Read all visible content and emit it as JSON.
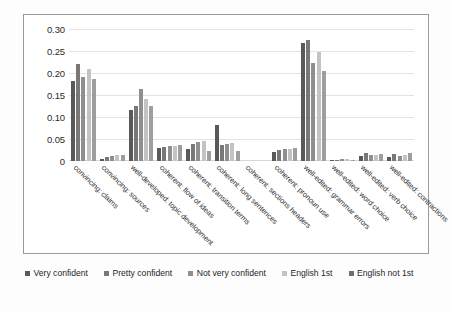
{
  "chart_data": {
    "type": "bar",
    "title": "",
    "subtitle": "",
    "xlabel": "",
    "ylabel": "",
    "ylim": [
      0,
      0.3
    ],
    "grid": true,
    "legend_position": "bottom",
    "ytick_labels": [
      "0.30",
      "0.25",
      "0.20",
      "0.15",
      "0.10",
      "0.05",
      "0"
    ],
    "ytick_values": [
      0.3,
      0.25,
      0.2,
      0.15,
      0.1,
      0.05,
      0
    ],
    "categories": [
      "convincing: claims",
      "convincing: sources",
      "well-developed: topic development",
      "coherent: flow of ideas",
      "coherent: transition terms",
      "coherent: long sentences",
      "coherent: sections headers",
      "coherent: pronoun use",
      "well-edited: grammar errors",
      "well-edited: word choice",
      "well-edited: verb choice",
      "well-edited: contractions"
    ],
    "series": [
      {
        "name": "Very confident",
        "color": "#595959",
        "values": [
          0.181,
          0.004,
          0.115,
          0.03,
          0.028,
          0.081,
          0.0,
          0.02,
          0.268,
          0.002,
          0.011,
          0.01
        ]
      },
      {
        "name": "Pretty confident",
        "color": "#787878",
        "values": [
          0.221,
          0.01,
          0.124,
          0.032,
          0.038,
          0.036,
          0.0,
          0.026,
          0.274,
          0.003,
          0.018,
          0.016
        ]
      },
      {
        "name": "Not very confident",
        "color": "#8f8f8f",
        "values": [
          0.192,
          0.012,
          0.163,
          0.035,
          0.043,
          0.038,
          0.0,
          0.027,
          0.222,
          0.004,
          0.013,
          0.011
        ]
      },
      {
        "name": "English 1st",
        "color": "#c3c3c3",
        "values": [
          0.21,
          0.013,
          0.141,
          0.033,
          0.046,
          0.041,
          0.0,
          0.028,
          0.247,
          0.004,
          0.014,
          0.013
        ]
      },
      {
        "name": "English not 1st",
        "color": "#9e9e9e",
        "values": [
          0.186,
          0.014,
          0.126,
          0.036,
          0.022,
          0.022,
          0.0,
          0.029,
          0.204,
          0.003,
          0.015,
          0.018
        ]
      }
    ]
  },
  "legend": {
    "items": [
      {
        "label": "Very confident",
        "color": "#595959"
      },
      {
        "label": "Pretty confident",
        "color": "#787878"
      },
      {
        "label": "Not very confident",
        "color": "#8f8f8f"
      },
      {
        "label": "English 1st",
        "color": "#c3c3c3"
      },
      {
        "label": "English not 1st",
        "color": "#6f6f6f"
      }
    ]
  }
}
